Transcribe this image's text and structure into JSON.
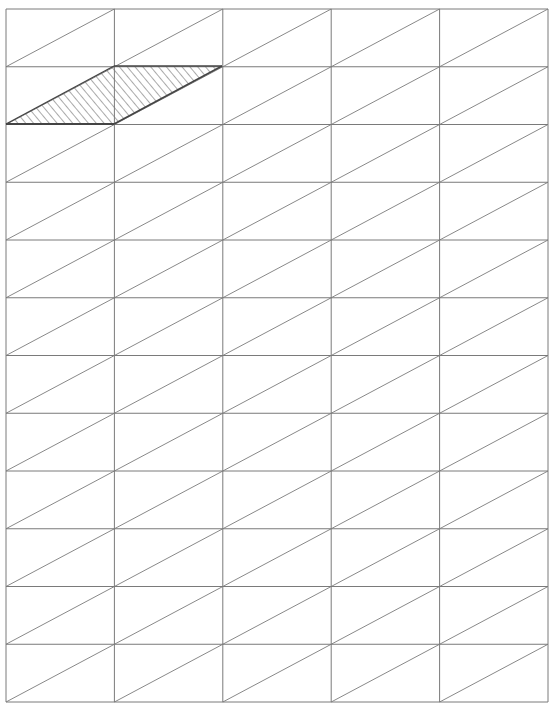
{
  "diagram": {
    "type": "triangulated-grid",
    "columns": 5,
    "rows": 12,
    "bounds": {
      "left": 6,
      "top": 9,
      "right": 548,
      "bottom": 702
    },
    "diagonal_direction": "bottom-left-to-top-right",
    "line_color": "#7a7a7a",
    "highlight": {
      "shape": "parallelogram",
      "fill": "diagonal-hatch",
      "hatch_color": "#555555",
      "edge_color": "#444444",
      "cells": [
        {
          "row": 1,
          "col": 0,
          "triangle": "upper-right"
        },
        {
          "row": 1,
          "col": 1,
          "triangle": "upper-left"
        }
      ],
      "vertices": [
        [
          6,
          124
        ],
        [
          114,
          66
        ],
        [
          222,
          66
        ],
        [
          114,
          124
        ]
      ]
    }
  }
}
